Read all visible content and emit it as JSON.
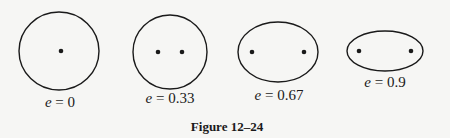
{
  "figure": {
    "caption": "Figure 12–24",
    "stroke_color": "#1a1a1a",
    "background": "#f6f6f4",
    "ellipses": [
      {
        "id": "e0",
        "variable": "e",
        "equals": "=",
        "value": "0",
        "cx": 59,
        "cy": 51,
        "rx": 40,
        "ry": 39,
        "foci": [
          [
            61,
            51
          ]
        ],
        "label_x": 60,
        "label_y": 94
      },
      {
        "id": "e33",
        "variable": "e",
        "equals": "=",
        "value": "0.33",
        "cx": 170,
        "cy": 52,
        "rx": 37,
        "ry": 37,
        "foci": [
          [
            158,
            52
          ],
          [
            182,
            52
          ]
        ],
        "label_x": 170,
        "label_y": 90
      },
      {
        "id": "e67",
        "variable": "e",
        "equals": "=",
        "value": "0.67",
        "cx": 278,
        "cy": 52,
        "rx": 40,
        "ry": 30,
        "foci": [
          [
            252,
            52
          ],
          [
            304,
            52
          ]
        ],
        "label_x": 279,
        "label_y": 87
      },
      {
        "id": "e9",
        "variable": "e",
        "equals": "=",
        "value": "0.9",
        "cx": 385,
        "cy": 51,
        "rx": 38,
        "ry": 20,
        "foci": [
          [
            359,
            51
          ],
          [
            411,
            51
          ]
        ],
        "label_x": 385,
        "label_y": 74
      }
    ]
  }
}
